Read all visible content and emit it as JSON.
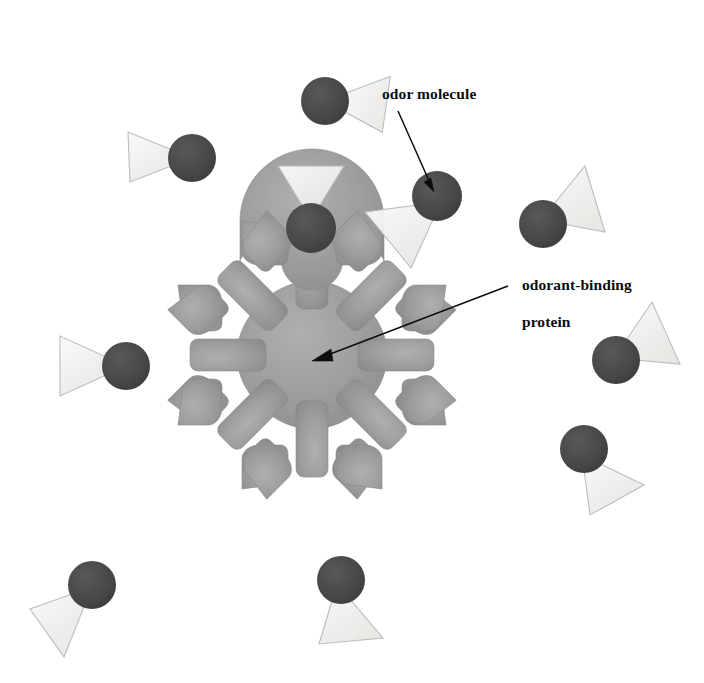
{
  "figure": {
    "kind": "biology-illustration",
    "background_color": "#ffffff",
    "width": 704,
    "height": 683
  },
  "labels": {
    "odor_molecule": "odor molecule",
    "odorant_binding_protein_line1": "odorant-binding",
    "odorant_binding_protein_line2": "protein"
  },
  "colors": {
    "protein_fill": "#9e9e9e",
    "protein_fill_light": "#adadad",
    "protein_fill_dark": "#8d8d8d",
    "protein_edge": "#8a8a8a",
    "molecule_circle": "#4a4a4a",
    "molecule_circle_dark": "#3d3d3d",
    "molecule_triangle_fill": "#f0f0ee",
    "molecule_triangle_edge": "#b9b9b6",
    "leader_line": "#0d0d0d",
    "text": "#0d0d0d"
  },
  "protein": {
    "name": "odorant-binding protein",
    "center": {
      "x": 312,
      "y": 355
    },
    "arm_count": 8,
    "arm_angles_deg": [
      270,
      315,
      0,
      45,
      90,
      135,
      180,
      225
    ],
    "core_radius": 74,
    "arm_length": 150,
    "pocket_radius": 27,
    "occupied_pockets": 1
  },
  "annotations": [
    {
      "id": "odor-molecule-callout",
      "text": "odor molecule",
      "text_x": 382,
      "text_y": 85,
      "line_from": {
        "x": 398,
        "y": 111
      },
      "line_to": {
        "x": 434,
        "y": 190
      }
    },
    {
      "id": "odorant-binding-protein-callout",
      "text": "odorant-binding protein",
      "text_x": 506,
      "text_y": 258,
      "line_from": {
        "x": 508,
        "y": 286
      },
      "line_to": {
        "x": 314,
        "y": 360
      }
    }
  ],
  "molecules": [
    {
      "id": "molecule-1",
      "position": "top-center",
      "cx": 325,
      "cy": 101,
      "r": 24,
      "triangle_angle_deg": 20,
      "bound": false
    },
    {
      "id": "molecule-2",
      "position": "upper-left",
      "cx": 192,
      "cy": 158,
      "r": 24,
      "triangle_angle_deg": 195,
      "bound": false
    },
    {
      "id": "molecule-3",
      "position": "top-arm-pocket",
      "cx": 311,
      "cy": 228,
      "r": 25,
      "triangle_angle_deg": 270,
      "bound": true
    },
    {
      "id": "molecule-4",
      "position": "labeled-right",
      "cx": 437,
      "cy": 196,
      "r": 25,
      "triangle_angle_deg": 200,
      "bound": false
    },
    {
      "id": "molecule-5",
      "position": "upper-right",
      "cx": 543,
      "cy": 224,
      "r": 24,
      "triangle_angle_deg": 15,
      "bound": false
    },
    {
      "id": "molecule-6",
      "position": "left",
      "cx": 126,
      "cy": 366,
      "r": 24,
      "triangle_angle_deg": 190,
      "bound": false
    },
    {
      "id": "molecule-7",
      "position": "right",
      "cx": 616,
      "cy": 360,
      "r": 24,
      "triangle_angle_deg": 15,
      "bound": false
    },
    {
      "id": "molecule-8",
      "position": "lower-right",
      "cx": 584,
      "cy": 449,
      "r": 24,
      "triangle_angle_deg": 48,
      "bound": false
    },
    {
      "id": "molecule-9",
      "position": "bottom-left",
      "cx": 92,
      "cy": 585,
      "r": 24,
      "triangle_angle_deg": 205,
      "bound": false
    },
    {
      "id": "molecule-10",
      "position": "bottom-center",
      "cx": 341,
      "cy": 580,
      "r": 24,
      "triangle_angle_deg": 78,
      "bound": false
    }
  ]
}
